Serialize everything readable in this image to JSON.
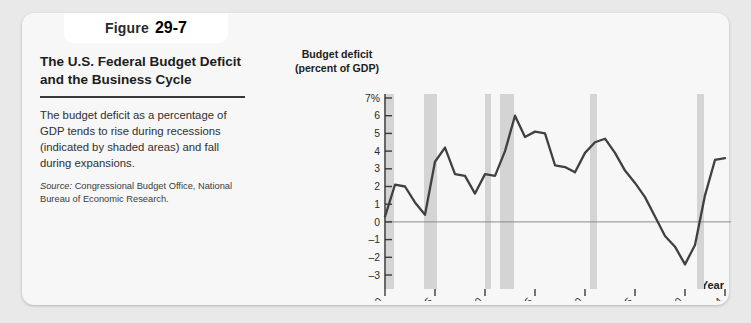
{
  "figure": {
    "tab_label": "Figure",
    "tab_number": "29-7",
    "title": "The U.S. Federal Budget Deficit and the Business Cycle",
    "body": "The budget deficit as a percentage of GDP tends to rise during recessions (indicated by shaded areas) and fall during expansions.",
    "source_label": "Source:",
    "source_text": "Congressional Budget Office, National Bureau of Economic Research."
  },
  "chart_data": {
    "type": "line",
    "title": "",
    "ylabel": "Budget deficit (percent of GDP)",
    "xlabel": "Year",
    "ylim": [
      -3,
      7
    ],
    "xlim": [
      1970,
      2004
    ],
    "grid": false,
    "legend": null,
    "zero_line": 0,
    "ytick_labels": [
      "7%",
      "6",
      "5",
      "4",
      "3",
      "2",
      "1",
      "0",
      "–1",
      "–2",
      "–3"
    ],
    "ytick_values": [
      7,
      6,
      5,
      4,
      3,
      2,
      1,
      0,
      -1,
      -2,
      -3
    ],
    "xtick_labels": [
      "1970",
      "1975",
      "1980",
      "1985",
      "1990",
      "1995",
      "2000",
      "2004"
    ],
    "xtick_values": [
      1970,
      1975,
      1980,
      1985,
      1990,
      1995,
      2000,
      2004
    ],
    "line_color": "#404040",
    "band_color": "#d4d4d4",
    "series": [
      {
        "name": "Budget deficit (percent of GDP)",
        "x": [
          1970,
          1971,
          1972,
          1973,
          1974,
          1975,
          1976,
          1977,
          1978,
          1979,
          1980,
          1981,
          1982,
          1983,
          1984,
          1985,
          1986,
          1987,
          1988,
          1989,
          1990,
          1991,
          1992,
          1993,
          1994,
          1995,
          1996,
          1997,
          1998,
          1999,
          2000,
          2001,
          2002,
          2003,
          2004
        ],
        "values": [
          0.3,
          2.1,
          2.0,
          1.1,
          0.4,
          3.4,
          4.2,
          2.7,
          2.6,
          1.6,
          2.7,
          2.6,
          4.0,
          6.0,
          4.8,
          5.1,
          5.0,
          3.2,
          3.1,
          2.8,
          3.9,
          4.5,
          4.7,
          3.9,
          2.9,
          2.2,
          1.4,
          0.3,
          -0.8,
          -1.4,
          -2.4,
          -1.3,
          1.5,
          3.5,
          3.6
        ]
      }
    ],
    "recession_bands": [
      {
        "start": 1969.9,
        "end": 1970.9
      },
      {
        "start": 1973.9,
        "end": 1975.2
      },
      {
        "start": 1980.0,
        "end": 1980.6
      },
      {
        "start": 1981.5,
        "end": 1982.9
      },
      {
        "start": 1990.5,
        "end": 1991.2
      },
      {
        "start": 2001.2,
        "end": 2001.9
      }
    ]
  }
}
